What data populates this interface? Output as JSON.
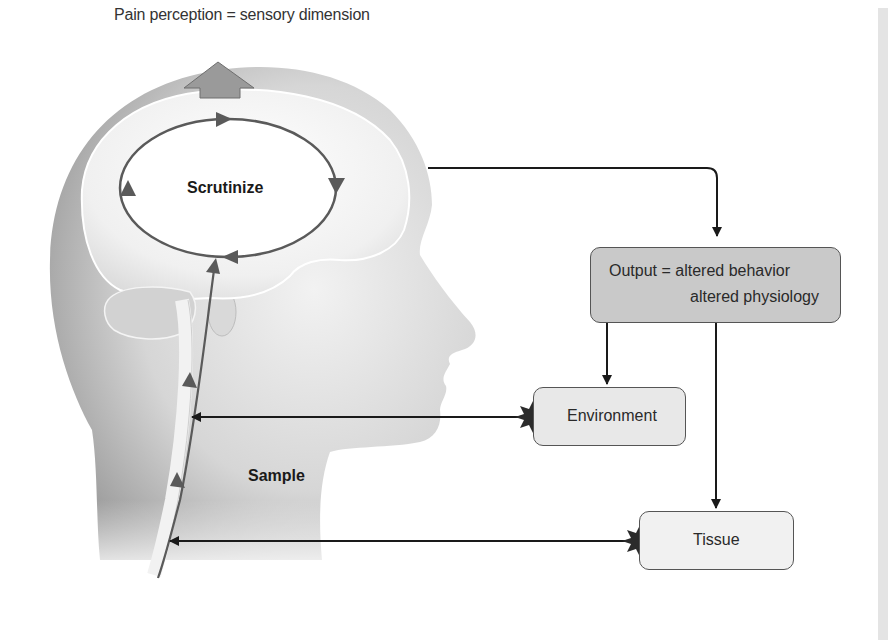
{
  "labels": {
    "top": "Pain perception = sensory dimension",
    "scrutinize": "Scrutinize",
    "sample": "Sample"
  },
  "boxes": {
    "output": {
      "line1": "Output = altered behavior",
      "line2": "altered physiology"
    },
    "environment": {
      "label": "Environment"
    },
    "tissue": {
      "label": "Tissue"
    }
  },
  "colors": {
    "cycle_arrow": "#5a5a5a",
    "connector": "#1a1a1a",
    "output_fill": "#c9c9c9",
    "environment_fill": "#e8e8e8",
    "tissue_fill": "#f1f1f1",
    "burst": "#2b2b2b"
  }
}
